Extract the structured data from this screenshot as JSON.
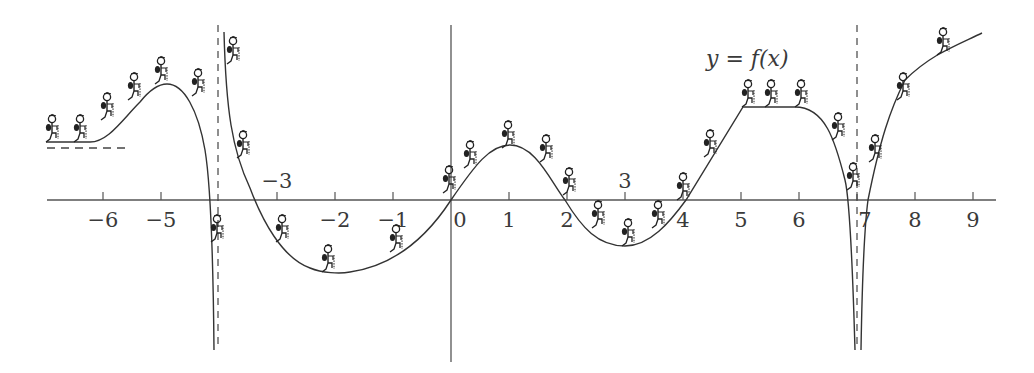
{
  "chart_data": {
    "type": "line",
    "title": "",
    "function_label": "y = f(x)",
    "xlabel": "",
    "ylabel": "",
    "grid": false,
    "legend": "none",
    "xlim": [
      -7.0,
      9.3
    ],
    "x_ticks": [
      -6,
      -5,
      -3,
      -2,
      -1,
      0,
      1,
      2,
      3,
      4,
      5,
      6,
      7,
      8,
      9
    ],
    "x_tick_labels": [
      "−6",
      "−5",
      "−3",
      "−2",
      "−1",
      "0",
      "1",
      "2",
      "3",
      "4",
      "5",
      "6",
      "7",
      "8",
      "9"
    ],
    "labels_above_axis": [
      "−3",
      "3"
    ],
    "vertical_asymptotes": [
      -4,
      7
    ],
    "horizontal_asymptote_left": 0.9,
    "key_points": [
      {
        "x": -6.9,
        "y": 1.0,
        "note": "curve starts near horizontal asymptote"
      },
      {
        "x": -5.0,
        "y": 2.0,
        "note": "local maximum"
      },
      {
        "x": -4.2,
        "y": 0.0,
        "note": "root, then drops to -inf at x=-4"
      },
      {
        "x": -3.9,
        "y": 3.0,
        "note": "comes from +inf right of x=-4"
      },
      {
        "x": -3.2,
        "y": 0.0,
        "note": "root"
      },
      {
        "x": -2.0,
        "y": -1.25,
        "note": "local minimum"
      },
      {
        "x": 0.0,
        "y": 0.0,
        "note": "root / inflection"
      },
      {
        "x": 1.0,
        "y": 0.95,
        "note": "local maximum"
      },
      {
        "x": 2.0,
        "y": 0.0,
        "note": "root"
      },
      {
        "x": 3.0,
        "y": -0.8,
        "note": "local minimum"
      },
      {
        "x": 4.0,
        "y": 0.0,
        "note": "root"
      },
      {
        "x": 5.0,
        "y": 1.6,
        "note": "corner, start of plateau"
      },
      {
        "x": 6.0,
        "y": 1.6,
        "note": "end of plateau"
      },
      {
        "x": 6.8,
        "y": 0.0,
        "note": "root, then drops to -inf at x=7"
      },
      {
        "x": 7.2,
        "y": 0.0,
        "note": "root after -inf right of x=7"
      },
      {
        "x": 9.2,
        "y": 2.8,
        "note": "curve end, increasing"
      }
    ],
    "decorations": "stick-figure hikers walking along the curve"
  },
  "hiker_count": 30
}
